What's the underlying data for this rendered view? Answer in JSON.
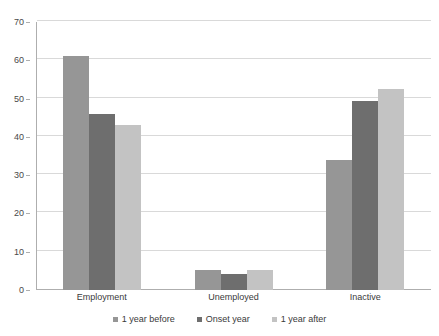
{
  "chart_data": {
    "type": "bar",
    "title": "",
    "subtitle": "",
    "xlabel": "",
    "ylabel": "",
    "ylim": [
      0,
      70
    ],
    "yticks": [
      0,
      10,
      20,
      30,
      40,
      50,
      60,
      70
    ],
    "ytick_labels": [
      "0",
      "10",
      "20",
      "30",
      "40",
      "50",
      "60",
      "70"
    ],
    "grid": true,
    "legend_position": "bottom-center",
    "orientation": "vertical",
    "grouping": "grouped",
    "categories": [
      "Employment",
      "Unemployed",
      "Inactive"
    ],
    "series": [
      {
        "name": "1 year before",
        "color": "#969696",
        "values": [
          61,
          5.3,
          34
        ]
      },
      {
        "name": "Onset year",
        "color": "#6e6e6e",
        "values": [
          46,
          4.3,
          49.5
        ]
      },
      {
        "name": "1 year after",
        "color": "#c3c3c3",
        "values": [
          43,
          5.3,
          52.5
        ]
      }
    ]
  },
  "style": {
    "axis_color": "#aeaeae",
    "grid_color": "#d9d9d9",
    "text_color": "#3a3a3a",
    "background": "#ffffff"
  }
}
